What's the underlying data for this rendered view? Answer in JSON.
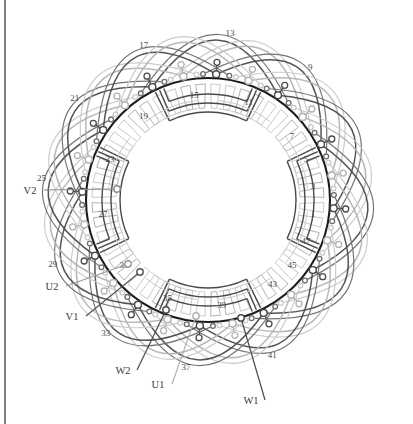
{
  "figure": {
    "kind": "stator-winding-diagram",
    "background": "#ffffff",
    "frame_color": "#2b2b2b",
    "center": {
      "x": 208,
      "y": 200
    },
    "bore_radius": 122,
    "bore_inner_radius": 78,
    "bore_stroke": "#1c1c1c",
    "bore_stroke_width": 2.1,
    "slot_count": 48,
    "slot_pitch_deg": 7.5,
    "phase_colors": {
      "dark": "#4a4a4a",
      "light": "#b3b3b3",
      "mid": "#6e6e6e",
      "pale": "#c9c9c9"
    },
    "left_border_x": 5
  },
  "slot_labels": [
    {
      "num": "1",
      "angle": 97.5
    },
    {
      "num": "3",
      "angle": 82.5
    },
    {
      "num": "5",
      "angle": 67.5
    },
    {
      "num": "7",
      "angle": 52.5
    },
    {
      "num": "9",
      "angle": 37.5
    },
    {
      "num": "11",
      "angle": 22.5
    },
    {
      "num": "13",
      "angle": 7.5
    },
    {
      "num": "15",
      "angle": 352.5
    },
    {
      "num": "17",
      "angle": 337.5
    },
    {
      "num": "19",
      "angle": 322.5
    },
    {
      "num": "21",
      "angle": 307.5
    },
    {
      "num": "23",
      "angle": 292.5
    },
    {
      "num": "25",
      "angle": 277.5
    },
    {
      "num": "27",
      "angle": 262.5
    },
    {
      "num": "29",
      "angle": 247.5
    },
    {
      "num": "31",
      "angle": 232.5
    },
    {
      "num": "33",
      "angle": 217.5
    },
    {
      "num": "35",
      "angle": 202.5
    },
    {
      "num": "37",
      "angle": 187.5
    },
    {
      "num": "39",
      "angle": 172.5
    },
    {
      "num": "41",
      "angle": 157.5
    },
    {
      "num": "43",
      "angle": 142.5
    },
    {
      "num": "45",
      "angle": 127.5
    },
    {
      "num": "47",
      "angle": 112.5
    }
  ],
  "inner_slot_labels": [
    "1",
    "3",
    "5",
    "7",
    "11",
    "15",
    "19",
    "23",
    "27",
    "31",
    "35",
    "39",
    "43",
    "45",
    "47"
  ],
  "outer_slot_labels": [
    "9",
    "13",
    "17",
    "21",
    "25",
    "29",
    "33",
    "37",
    "41"
  ],
  "terminals": [
    {
      "id": "V2",
      "label": "V2",
      "label_x": 30,
      "label_y": 194,
      "lead_to_x": 117,
      "lead_to_y": 189,
      "color": "#8a8a8a"
    },
    {
      "id": "U2",
      "label": "U2",
      "label_x": 52,
      "label_y": 290,
      "lead_to_x": 128,
      "lead_to_y": 264,
      "color": "#9a9a9a"
    },
    {
      "id": "V1",
      "label": "V1",
      "label_x": 72,
      "label_y": 320,
      "lead_to_x": 140,
      "lead_to_y": 272,
      "color": "#555555"
    },
    {
      "id": "W2",
      "label": "W2",
      "label_x": 123,
      "label_y": 374,
      "lead_to_x": 166,
      "lead_to_y": 310,
      "color": "#4a4a4a"
    },
    {
      "id": "U1",
      "label": "U1",
      "label_x": 158,
      "label_y": 388,
      "lead_to_x": 196,
      "lead_to_y": 316,
      "color": "#b3b3b3"
    },
    {
      "id": "W1",
      "label": "W1",
      "label_x": 251,
      "label_y": 404,
      "lead_to_x": 241,
      "lead_to_y": 318,
      "color": "#4a4a4a"
    }
  ],
  "legend_note": "48-slot three-phase stator winding layout with U, V and W phase start and finish leads"
}
